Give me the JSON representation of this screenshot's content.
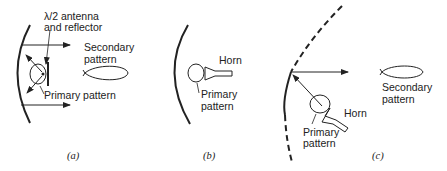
{
  "figure": {
    "panels": [
      {
        "id": "a",
        "caption": "(a)",
        "labels": {
          "antenna_line1": "λ/2 antenna",
          "antenna_line2": "and reflector",
          "secondary_line1": "Secondary",
          "secondary_line2": "pattern",
          "primary": "Primary pattern"
        }
      },
      {
        "id": "b",
        "caption": "(b)",
        "labels": {
          "horn": "Horn",
          "primary_line1": "Primary",
          "primary_line2": "pattern"
        }
      },
      {
        "id": "c",
        "caption": "(c)",
        "labels": {
          "horn": "Horn",
          "primary_line1": "Primary",
          "primary_line2": "pattern",
          "secondary_line1": "Secondary",
          "secondary_line2": "pattern"
        }
      }
    ],
    "colors": {
      "ink": "#222222",
      "background": "#ffffff"
    }
  }
}
